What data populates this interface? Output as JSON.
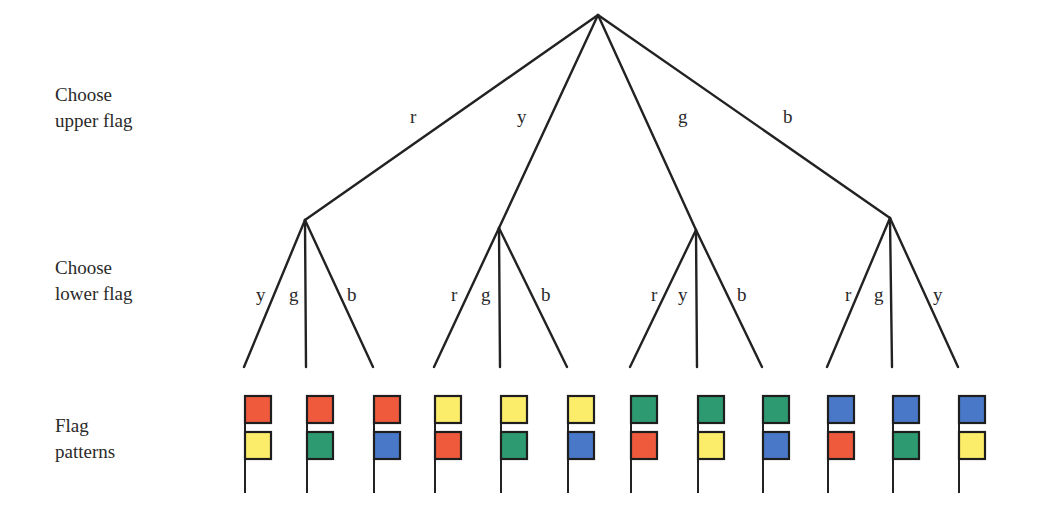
{
  "colors": {
    "r": "#f05a3c",
    "y": "#fbec6a",
    "g": "#2e9a72",
    "b": "#4a78c8",
    "line": "#222222"
  },
  "row_labels": {
    "upper": [
      "Choose",
      "upper flag"
    ],
    "lower": [
      "Choose",
      "lower flag"
    ],
    "patterns": [
      "Flag",
      "patterns"
    ]
  },
  "root": {
    "x": 598,
    "y": 15
  },
  "branches": [
    {
      "upper": "r",
      "label_pos": {
        "x": 410,
        "y": 123
      },
      "node": {
        "x": 305,
        "y": 220
      },
      "children": [
        {
          "lower": "y",
          "leaf_x": 244,
          "label_pos": {
            "x": 256,
            "y": 301
          }
        },
        {
          "lower": "g",
          "leaf_x": 306,
          "label_pos": {
            "x": 289,
            "y": 301
          }
        },
        {
          "lower": "b",
          "leaf_x": 373,
          "label_pos": {
            "x": 347,
            "y": 301
          }
        }
      ]
    },
    {
      "upper": "y",
      "label_pos": {
        "x": 517,
        "y": 123
      },
      "node": {
        "x": 499,
        "y": 228
      },
      "children": [
        {
          "lower": "r",
          "leaf_x": 434,
          "label_pos": {
            "x": 451,
            "y": 301
          }
        },
        {
          "lower": "g",
          "leaf_x": 500,
          "label_pos": {
            "x": 481,
            "y": 301
          }
        },
        {
          "lower": "b",
          "leaf_x": 567,
          "label_pos": {
            "x": 541,
            "y": 301
          }
        }
      ]
    },
    {
      "upper": "g",
      "label_pos": {
        "x": 678,
        "y": 123
      },
      "node": {
        "x": 696,
        "y": 230
      },
      "children": [
        {
          "lower": "r",
          "leaf_x": 630,
          "label_pos": {
            "x": 651,
            "y": 301
          }
        },
        {
          "lower": "y",
          "leaf_x": 697,
          "label_pos": {
            "x": 678,
            "y": 301
          }
        },
        {
          "lower": "b",
          "leaf_x": 762,
          "label_pos": {
            "x": 737,
            "y": 301
          }
        }
      ]
    },
    {
      "upper": "b",
      "label_pos": {
        "x": 783,
        "y": 123
      },
      "node": {
        "x": 890,
        "y": 218
      },
      "children": [
        {
          "lower": "r",
          "leaf_x": 827,
          "label_pos": {
            "x": 845,
            "y": 301
          }
        },
        {
          "lower": "g",
          "leaf_x": 892,
          "label_pos": {
            "x": 874,
            "y": 301
          }
        },
        {
          "lower": "y",
          "leaf_x": 958,
          "label_pos": {
            "x": 933,
            "y": 301
          }
        }
      ]
    }
  ],
  "leaf_y": 367,
  "flag_geometry": {
    "pole_top": 395,
    "pole_bottom": 493,
    "flag_w": 26,
    "flag_h": 27,
    "upper_y": 396,
    "lower_y": 432
  },
  "patterns": [
    {
      "upper": "r",
      "lower": "y"
    },
    {
      "upper": "r",
      "lower": "g"
    },
    {
      "upper": "r",
      "lower": "b"
    },
    {
      "upper": "y",
      "lower": "r"
    },
    {
      "upper": "y",
      "lower": "g"
    },
    {
      "upper": "y",
      "lower": "b"
    },
    {
      "upper": "g",
      "lower": "r"
    },
    {
      "upper": "g",
      "lower": "y"
    },
    {
      "upper": "g",
      "lower": "b"
    },
    {
      "upper": "b",
      "lower": "r"
    },
    {
      "upper": "b",
      "lower": "g"
    },
    {
      "upper": "b",
      "lower": "y"
    }
  ]
}
